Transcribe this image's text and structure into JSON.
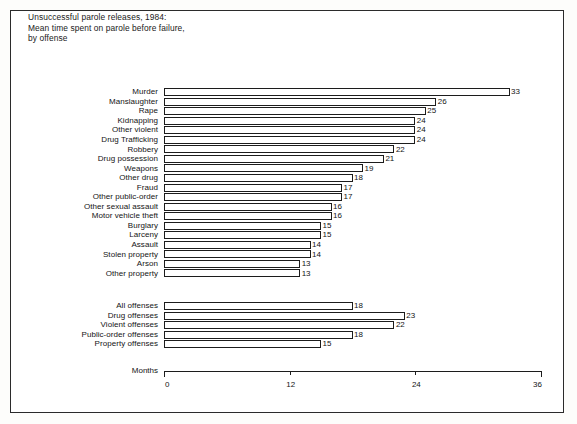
{
  "title_lines": [
    "Unsuccessful parole releases, 1984:",
    "Mean time spent on parole before failure,",
    "by offense"
  ],
  "axis_title": "Months",
  "chart_data": {
    "type": "bar",
    "orientation": "horizontal",
    "title": "Unsuccessful parole releases, 1984: Mean time spent on parole before failure, by offense",
    "xlabel": "Months",
    "ylabel": "",
    "xlim": [
      0,
      36
    ],
    "xticks": [
      0,
      12,
      24,
      36
    ],
    "xtick_labels": [
      "0",
      "12",
      "24",
      "36"
    ],
    "grid": false,
    "legend": false,
    "groups": [
      {
        "name": "by-offense",
        "categories": [
          "Murder",
          "Manslaughter",
          "Rape",
          "Kidnapping",
          "Other violent",
          "Drug Trafficking",
          "Robbery",
          "Drug possession",
          "Weapons",
          "Other drug",
          "Fraud",
          "Other public-order",
          "Other sexual assault",
          "Motor vehicle theft",
          "Burglary",
          "Larceny",
          "Assault",
          "Stolen property",
          "Arson",
          "Other property"
        ],
        "values": [
          33,
          26,
          25,
          24,
          24,
          24,
          22,
          21,
          19,
          18,
          17,
          17,
          16,
          16,
          15,
          15,
          14,
          14,
          13,
          13
        ]
      },
      {
        "name": "summary",
        "categories": [
          "All offenses",
          "Drug offenses",
          "Violent offenses",
          "Public-order offenses",
          "Property offenses"
        ],
        "values": [
          18,
          23,
          22,
          18,
          15
        ]
      }
    ]
  }
}
